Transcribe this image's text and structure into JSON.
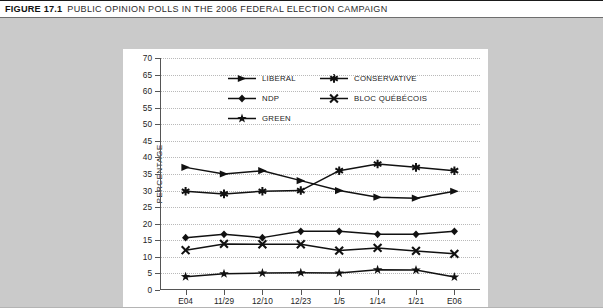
{
  "caption": {
    "number": "FIGURE 17.1",
    "text": "PUBLIC OPINION POLLS IN THE 2006 FEDERAL ELECTION CAMPAIGN"
  },
  "colors": {
    "series": "#111111",
    "panel": "#ffffff",
    "field": "#cacaca",
    "grid": "#b9b9b9",
    "axis": "#555555"
  },
  "chart_data": {
    "type": "line",
    "title": "PUBLIC OPINION POLLS IN THE 2006 FEDERAL ELECTION CAMPAIGN",
    "xlabel": "",
    "ylabel": "PERCENTAGE",
    "categories": [
      "E04",
      "11/29",
      "12/10",
      "12/23",
      "1/5",
      "1/14",
      "1/21",
      "E06"
    ],
    "ylim": [
      0,
      70
    ],
    "ytick_step": 5,
    "yticks": [
      0,
      5,
      10,
      15,
      20,
      25,
      30,
      35,
      40,
      45,
      50,
      55,
      60,
      65,
      70
    ],
    "grid": true,
    "legend_position": "upper-center",
    "series": [
      {
        "name": "LIBERAL",
        "marker": "triangle-right",
        "values": [
          37,
          35,
          36,
          33,
          30,
          28,
          27.7,
          29.8
        ]
      },
      {
        "name": "CONSERVATIVE",
        "marker": "asterisk",
        "values": [
          29.8,
          29,
          29.8,
          30,
          36,
          38,
          37,
          36
        ]
      },
      {
        "name": "NDP",
        "marker": "diamond",
        "values": [
          15.8,
          16.8,
          15.8,
          17.7,
          17.7,
          16.8,
          16.8,
          17.7
        ]
      },
      {
        "name": "BLOC QUÉBÉCOIS",
        "marker": "x",
        "values": [
          12,
          13.9,
          13.8,
          13.8,
          11.9,
          12.7,
          11.8,
          10.9
        ]
      },
      {
        "name": "GREEN",
        "marker": "star",
        "values": [
          4,
          4.9,
          5.1,
          5.2,
          5.1,
          6.1,
          6,
          3.9
        ]
      }
    ]
  }
}
